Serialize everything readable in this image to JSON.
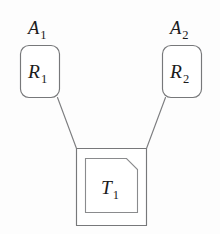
{
  "diagram": {
    "type": "node-link-tree",
    "background_color": "#fdfdfd",
    "stroke_color": "#7d7e80",
    "text_color": "#1b1b1b",
    "nodes": [
      {
        "id": "agent-1",
        "outer_label_base": "A",
        "outer_label_sub": "1",
        "inner_label_base": "R",
        "inner_label_sub": "1",
        "shape": "rounded-rectangle"
      },
      {
        "id": "agent-2",
        "outer_label_base": "A",
        "outer_label_sub": "2",
        "inner_label_base": "R",
        "inner_label_sub": "2",
        "shape": "rounded-rectangle"
      },
      {
        "id": "task-1",
        "inner_label_base": "T",
        "inner_label_sub": "1",
        "shape": "square-with-clipped-corner-inset"
      }
    ],
    "edges": [
      {
        "from": "agent-1",
        "to": "task-1"
      },
      {
        "from": "agent-2",
        "to": "task-1"
      }
    ]
  }
}
